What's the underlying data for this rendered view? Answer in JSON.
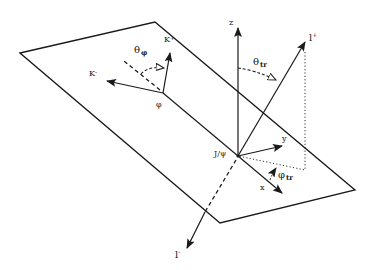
{
  "figure": {
    "colors": {
      "line": "#1a1a1a",
      "background": "#ffffff"
    }
  },
  "labels": {
    "z_axis": "z",
    "y_axis": "y",
    "x_axis": "x",
    "origin": "J/ψ",
    "l_plus": "l",
    "l_plus_sup": "+",
    "l_minus": "l",
    "l_minus_sup": "-",
    "k_plus": "K",
    "k_plus_sup": "+",
    "k_minus": "K",
    "k_minus_sup": "-",
    "phi": "φ",
    "theta_phi": "θ",
    "theta_phi_sub": "φ",
    "theta_tr": "θ",
    "theta_tr_sub": "tr",
    "phi_tr": "φ",
    "phi_tr_sub": "tr"
  }
}
